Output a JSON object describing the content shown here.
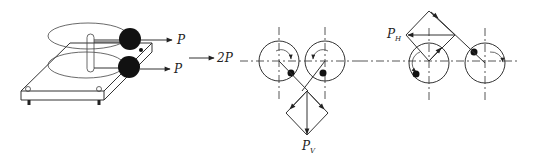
{
  "figure": {
    "panel_a": {
      "description": "Two counter-rotating eccentric masses on a vibrating plate",
      "force_top": "P",
      "force_bottom": "P",
      "result_label": "2P"
    },
    "panel_b": {
      "description": "Eccentric masses in symmetric position; vertical resultant",
      "resultant_label": "P",
      "resultant_subscript": "V"
    },
    "panel_c": {
      "description": "Eccentric masses in asymmetric position; horizontal resultant",
      "resultant_label": "P",
      "resultant_subscript": "H"
    }
  }
}
